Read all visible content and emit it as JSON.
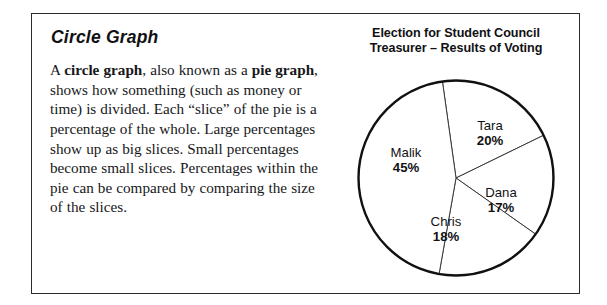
{
  "page": {
    "title": "Circle Graph",
    "body_paragraph": {
      "full_text": "A circle graph, also known as a pie graph, shows how something (such as money or time) is divided.  Each “slice” of the pie is a percentage of the whole.  Large percentages show up as big slices.  Small percentages become small slices.  Percentages within the pie can be compared by comparing the size of the slices.",
      "segments": [
        {
          "text": "A ",
          "bold": false
        },
        {
          "text": "circle graph",
          "bold": true
        },
        {
          "text": ", also known as a ",
          "bold": false
        },
        {
          "text": "pie graph",
          "bold": true
        },
        {
          "text": ", shows how something (such as money or time) is divided.  Each “slice” of the pie is a percentage of the whole.  Large percentages show up as big slices.  Small percentages become small slices.  Percentages within the pie can be compared by comparing the size of the slices.",
          "bold": false
        }
      ]
    }
  },
  "chart_data": {
    "type": "pie",
    "title": "Election for Student Council Treasurer – Results of Voting",
    "title_line1": "Election for Student Council",
    "title_line2": "Treasurer – Results of Voting",
    "categories": [
      "Tara",
      "Dana",
      "Chris",
      "Malik"
    ],
    "values": [
      20,
      17,
      18,
      45
    ],
    "unit": "%",
    "labels": [
      {
        "name": "Tara",
        "pct": "20%",
        "value": 20
      },
      {
        "name": "Dana",
        "pct": "17%",
        "value": 17
      },
      {
        "name": "Chris",
        "pct": "18%",
        "value": 18
      },
      {
        "name": "Malik",
        "pct": "45%",
        "value": 45
      }
    ],
    "legend": "none",
    "data_labels": true,
    "start_angle_deg": -8,
    "colors": {
      "slice_fill": "#ffffff",
      "outline": "#111114",
      "divider": "#3a3a3e"
    }
  },
  "style": {
    "background": "#ffffff",
    "border_color": "#2b2b2f",
    "text_color": "#17171a"
  }
}
